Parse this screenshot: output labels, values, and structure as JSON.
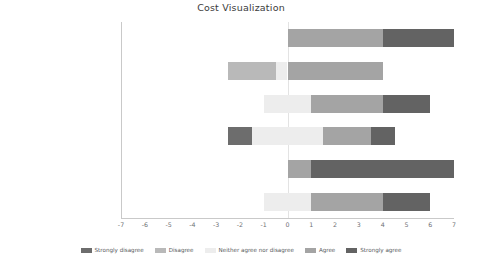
{
  "chart_data": {
    "type": "bar",
    "title": "Cost Visualization",
    "xlabel": "",
    "ylabel": "",
    "xlim": [
      -7,
      7
    ],
    "grid": false,
    "legend_position": "bottom",
    "orientation": "horizontal",
    "stacked": "diverging",
    "xticks": [
      "-7",
      "-6",
      "-5",
      "-4",
      "-3",
      "-2",
      "-1",
      "0",
      "1",
      "2",
      "3",
      "4",
      "5",
      "6",
      "7"
    ],
    "xtick_values": [
      -7,
      -6,
      -5,
      -4,
      -3,
      -2,
      -1,
      0,
      1,
      2,
      3,
      4,
      5,
      6,
      7
    ],
    "categories": [
      "This visualization motivated me to reduce food waste",
      "I was able to reduce food waste through this visualization",
      "I enjoyed this visualization",
      "This visualization was stressful",
      "This visualization helped me learn new information",
      "I would use this visualization again in my daily life."
    ],
    "series": [
      {
        "name": "Strongly disagree",
        "color": "#6d6d6d",
        "values": [
          0,
          0,
          0,
          1,
          0,
          0
        ]
      },
      {
        "name": "Disagree",
        "color": "#b9b9b9",
        "values": [
          0,
          2.5,
          0,
          0,
          0,
          0
        ]
      },
      {
        "name": "Neither agree nor disagree",
        "color": "#ededed",
        "values": [
          0,
          0.5,
          1,
          3,
          0,
          1
        ]
      },
      {
        "name": "Agree",
        "color": "#a4a4a4",
        "values": [
          4,
          4,
          3,
          2,
          1,
          3
        ]
      },
      {
        "name": "Strongly agree",
        "color": "#636363",
        "values": [
          3,
          0,
          2,
          1,
          6,
          2
        ]
      }
    ],
    "bars": [
      {
        "label": "This visualization motivated me to reduce food waste",
        "segments": [
          {
            "series": "Agree",
            "start": 0,
            "end": 4
          },
          {
            "series": "Strongly agree",
            "start": 4,
            "end": 7
          }
        ]
      },
      {
        "label": "I was able to reduce food waste through this visualization",
        "segments": [
          {
            "series": "Disagree",
            "start": -2.5,
            "end": -0.5
          },
          {
            "series": "Neither agree nor disagree",
            "start": -0.5,
            "end": 0
          },
          {
            "series": "Agree",
            "start": 0,
            "end": 4
          }
        ]
      },
      {
        "label": "I enjoyed this visualization",
        "segments": [
          {
            "series": "Neither agree nor disagree",
            "start": -1,
            "end": 1
          },
          {
            "series": "Agree",
            "start": 1,
            "end": 4
          },
          {
            "series": "Strongly agree",
            "start": 4,
            "end": 6
          }
        ]
      },
      {
        "label": "This visualization was stressful",
        "segments": [
          {
            "series": "Strongly disagree",
            "start": -2.5,
            "end": -1.5
          },
          {
            "series": "Neither agree nor disagree",
            "start": -1.5,
            "end": 1.5
          },
          {
            "series": "Agree",
            "start": 1.5,
            "end": 3.5
          },
          {
            "series": "Strongly agree",
            "start": 3.5,
            "end": 4.5
          }
        ]
      },
      {
        "label": "This visualization helped me learn new information",
        "segments": [
          {
            "series": "Agree",
            "start": 0,
            "end": 1
          },
          {
            "series": "Strongly agree",
            "start": 1,
            "end": 7
          }
        ]
      },
      {
        "label": "I would use this visualization again in my daily life.",
        "segments": [
          {
            "series": "Neither agree nor disagree",
            "start": -1,
            "end": 1
          },
          {
            "series": "Agree",
            "start": 1,
            "end": 4
          },
          {
            "series": "Strongly agree",
            "start": 4,
            "end": 6
          }
        ]
      }
    ]
  },
  "ylabels": [
    [
      "This visualization motivated",
      "me to reduce food waste"
    ],
    [
      "I was able to reduce food",
      "waste through this",
      "visualization"
    ],
    [
      "I enjoyed this visualization"
    ],
    [
      "This visualization was",
      "stressful"
    ],
    [
      "This visualization helped me",
      "learn new information"
    ],
    [
      "I would use this visualization",
      "again in my daily life."
    ]
  ],
  "legend": [
    {
      "label": "Strongly disagree",
      "color": "#6d6d6d"
    },
    {
      "label": "Disagree",
      "color": "#b9b9b9"
    },
    {
      "label": "Neither agree nor disagree",
      "color": "#ededed"
    },
    {
      "label": "Agree",
      "color": "#a4a4a4"
    },
    {
      "label": "Strongly agree",
      "color": "#636363"
    }
  ]
}
